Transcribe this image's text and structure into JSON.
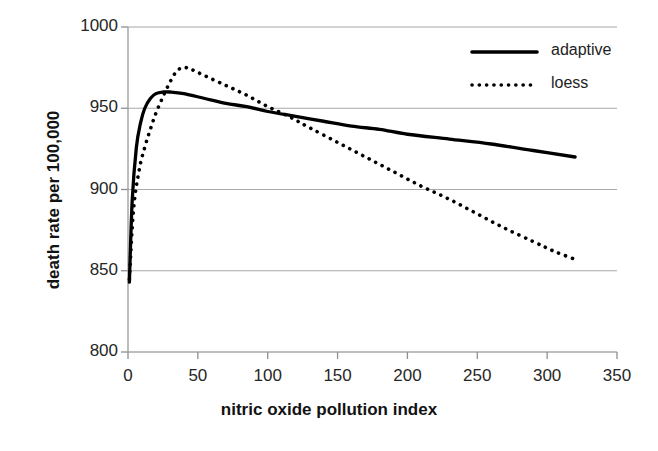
{
  "chart_data": {
    "type": "line",
    "title": "",
    "xlabel": "nitric oxide pollution index",
    "ylabel": "death rate per 100,000",
    "xlim": [
      0,
      350
    ],
    "ylim": [
      800,
      1000
    ],
    "xticks": [
      "0",
      "50",
      "100",
      "150",
      "200",
      "250",
      "300",
      "350"
    ],
    "xtick_values": [
      0,
      50,
      100,
      150,
      200,
      250,
      300,
      350
    ],
    "yticks": [
      "800",
      "850",
      "900",
      "950",
      "1000"
    ],
    "ytick_values": [
      800,
      850,
      900,
      950,
      1000
    ],
    "grid": "horizontal",
    "legend_position": "top-right",
    "series": [
      {
        "name": "adaptive",
        "style": "solid",
        "color": "#000000",
        "x": [
          1,
          3,
          6,
          9,
          12,
          16,
          20,
          25,
          30,
          40,
          55,
          70,
          85,
          100,
          120,
          140,
          160,
          180,
          200,
          230,
          260,
          290,
          320
        ],
        "y": [
          843,
          893,
          926,
          941,
          950,
          956,
          959,
          960,
          960,
          959,
          956,
          953,
          951,
          948,
          945,
          942,
          939,
          937,
          934,
          931,
          928,
          924,
          920
        ]
      },
      {
        "name": "loess",
        "style": "dotted",
        "color": "#000000",
        "x": [
          1,
          4,
          8,
          12,
          16,
          20,
          25,
          30,
          35,
          40,
          45,
          55,
          70,
          85,
          100,
          115,
          130,
          150,
          170,
          190,
          210,
          230,
          250,
          270,
          290,
          305,
          320
        ],
        "y": [
          845,
          888,
          912,
          926,
          937,
          947,
          957,
          966,
          973,
          975,
          974,
          970,
          964,
          958,
          951,
          945,
          938,
          929,
          920,
          911,
          902,
          894,
          885,
          876,
          868,
          862,
          857
        ]
      }
    ],
    "legend": [
      {
        "label": "adaptive",
        "style": "solid"
      },
      {
        "label": "loess",
        "style": "dotted"
      }
    ]
  }
}
